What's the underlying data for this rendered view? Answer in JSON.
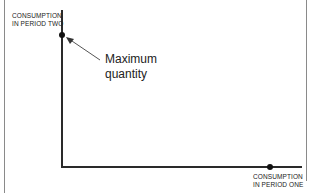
{
  "diagram": {
    "type": "intertemporal consumption axes",
    "y_axis_label": [
      "CONSUMPTION",
      "IN PERIOD TWO"
    ],
    "x_axis_label": [
      "CONSUMPTION",
      "IN PERIOD ONE"
    ],
    "annotation": [
      "Maximum",
      "quantity"
    ],
    "points": [
      {
        "name": "max-period-two",
        "axis": "y"
      },
      {
        "name": "max-period-one",
        "axis": "x"
      }
    ],
    "colors": {
      "axis": "#2a2a2a",
      "frame": "#8a8a8a",
      "text": "#222222"
    }
  }
}
